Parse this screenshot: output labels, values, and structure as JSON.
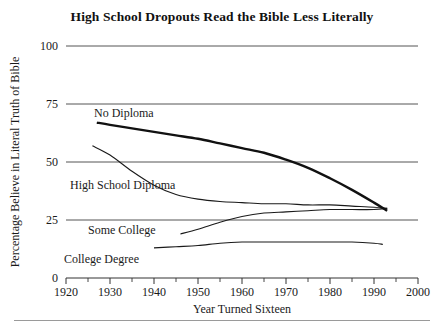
{
  "figure": {
    "title": "High School Dropouts Read the Bible Less Literally",
    "x_axis_title": "Year Turned Sixteen",
    "y_axis_title": "Percentage Believe in Literal Truth of Bible"
  },
  "axes": {
    "y_tick_labels": [
      "100",
      "75",
      "50",
      "25",
      "0"
    ],
    "x_tick_labels": [
      "1920",
      "1930",
      "1940",
      "1950",
      "1960",
      "1970",
      "1980",
      "1990",
      "2000"
    ]
  },
  "series_labels": {
    "no_diploma": "No Diploma",
    "high_school_diploma": "High School Diploma",
    "some_college": "Some College",
    "college_degree": "College Degree"
  },
  "chart_data": {
    "type": "line",
    "title": "High School Dropouts Read the Bible Less Literally",
    "subtitle": "",
    "xlabel": "Year Turned Sixteen",
    "ylabel": "Percentage Believe in Literal Truth of Bible",
    "xlim": [
      1920,
      2000
    ],
    "ylim": [
      0,
      100
    ],
    "xticks": [
      1920,
      1930,
      1940,
      1950,
      1960,
      1970,
      1980,
      1990,
      2000
    ],
    "xticks_minor": [
      1925,
      1935,
      1945,
      1955,
      1965,
      1975,
      1985,
      1995
    ],
    "yticks": [
      0,
      25,
      50,
      75,
      100
    ],
    "grid": "horizontal",
    "legend": "inline-labels",
    "series": [
      {
        "name": "No Diploma",
        "style": "thick",
        "x": [
          1927,
          1930,
          1935,
          1940,
          1945,
          1950,
          1955,
          1960,
          1965,
          1970,
          1975,
          1980,
          1985,
          1990,
          1993
        ],
        "values": [
          67,
          66,
          64.5,
          63,
          61.5,
          60,
          58,
          56,
          54,
          51,
          47.5,
          43,
          38,
          32.5,
          29
        ]
      },
      {
        "name": "High School Diploma",
        "style": "thin",
        "x": [
          1926,
          1930,
          1935,
          1940,
          1945,
          1950,
          1955,
          1960,
          1965,
          1970,
          1975,
          1980,
          1985,
          1990,
          1993
        ],
        "values": [
          57,
          53,
          46,
          40,
          36,
          34,
          33,
          32.5,
          32,
          32,
          31.5,
          31.5,
          31,
          30.5,
          30
        ]
      },
      {
        "name": "Some College",
        "style": "thin",
        "x": [
          1946,
          1950,
          1955,
          1960,
          1965,
          1970,
          1975,
          1980,
          1985,
          1990,
          1993
        ],
        "values": [
          19,
          21,
          24,
          26.5,
          28,
          28.5,
          29,
          29.5,
          29.5,
          29.5,
          30
        ]
      },
      {
        "name": "College Degree",
        "style": "thin",
        "x": [
          1940,
          1945,
          1950,
          1955,
          1960,
          1965,
          1970,
          1975,
          1980,
          1985,
          1990,
          1992
        ],
        "values": [
          13,
          13.5,
          14,
          15,
          15.5,
          15.5,
          15.5,
          15.5,
          15.5,
          15.5,
          15,
          14.5
        ]
      }
    ]
  }
}
